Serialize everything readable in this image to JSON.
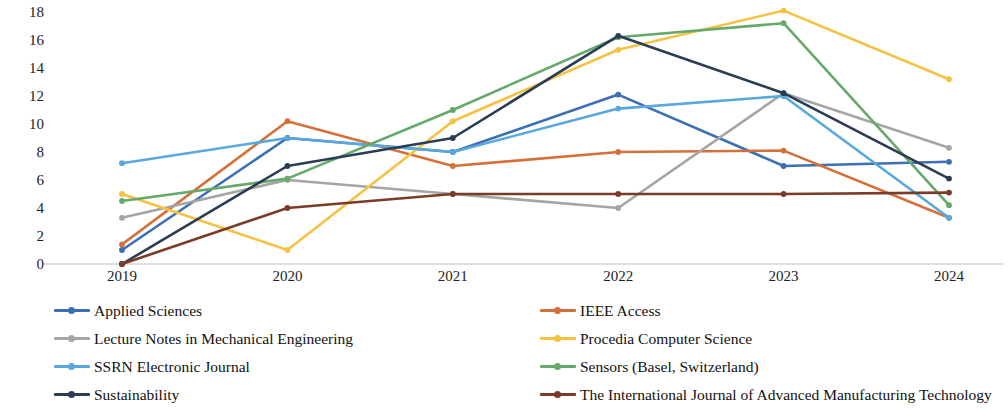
{
  "chart_data": {
    "type": "line",
    "title": "",
    "subtitle": "",
    "xlabel": "",
    "ylabel": "",
    "categories": [
      "2019",
      "2020",
      "2021",
      "2022",
      "2023",
      "2024"
    ],
    "x": [
      2019,
      2020,
      2021,
      2022,
      2023,
      2024
    ],
    "ylim": [
      0,
      18
    ],
    "y_ticks": [
      0,
      2,
      4,
      6,
      8,
      10,
      12,
      14,
      16,
      18
    ],
    "y_tick_labels": [
      "0",
      "2",
      "4",
      "6",
      "8",
      "10",
      "12",
      "14",
      "16",
      "18"
    ],
    "grid": false,
    "legend_position": "bottom",
    "markers": true,
    "series": [
      {
        "name": "Applied Sciences",
        "color": "#3b6fb6",
        "values": [
          1,
          9,
          8,
          12.1,
          7,
          7.3
        ]
      },
      {
        "name": "IEEE Access",
        "color": "#d4713b",
        "values": [
          1.4,
          10.2,
          7,
          8,
          8.1,
          3.3
        ]
      },
      {
        "name": "Lecture Notes in Mechanical Engineering",
        "color": "#a5a5a5",
        "values": [
          3.3,
          6,
          5,
          4,
          12.2,
          8.3
        ]
      },
      {
        "name": "Procedia Computer Science",
        "color": "#f5c242",
        "values": [
          5,
          1,
          10.2,
          15.3,
          18.1,
          13.2
        ]
      },
      {
        "name": "SSRN Electronic Journal",
        "color": "#59a8dd",
        "values": [
          7.2,
          9,
          8,
          11.1,
          12,
          3.3
        ]
      },
      {
        "name": "Sensors (Basel, Switzerland)",
        "color": "#66a96b",
        "values": [
          4.5,
          6.1,
          11,
          16.2,
          17.2,
          4.2
        ]
      },
      {
        "name": "Sustainability",
        "color": "#2b3c55",
        "values": [
          0,
          7,
          9,
          16.3,
          12.2,
          6.1
        ]
      },
      {
        "name": "The International Journal of Advanced Manufacturing Technology",
        "color": "#7a3b28",
        "values": [
          0,
          4,
          5,
          5,
          5,
          5.1
        ]
      }
    ]
  },
  "legend": {
    "left_column": [
      "Applied Sciences",
      "Lecture Notes in Mechanical Engineering",
      "SSRN Electronic Journal",
      "Sustainability"
    ],
    "right_column": [
      "IEEE Access",
      "Procedia Computer Science",
      "Sensors (Basel, Switzerland)",
      "The International Journal of Advanced Manufacturing Technology"
    ]
  },
  "axis": {
    "baseline_color": "#bfbfbf"
  }
}
